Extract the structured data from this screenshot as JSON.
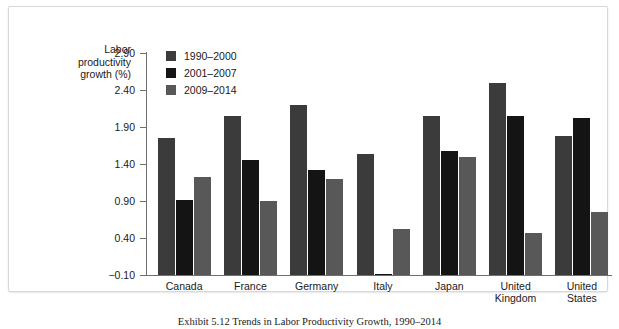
{
  "figure": {
    "caption": "Exhibit 5.12 Trends in Labor Productivity Growth, 1990–2014"
  },
  "chart_data": {
    "type": "bar",
    "title": "",
    "xlabel": "",
    "ylabel": "Labor productivity growth (%)",
    "ylabel_lines": [
      "Labor",
      "productivity",
      "growth (%)"
    ],
    "categories": [
      "Canada",
      "France",
      "Germany",
      "Italy",
      "Japan",
      "United Kingdom",
      "United States"
    ],
    "category_lines": [
      [
        "Canada"
      ],
      [
        "France"
      ],
      [
        "Germany"
      ],
      [
        "Italy"
      ],
      [
        "Japan"
      ],
      [
        "United",
        "Kingdom"
      ],
      [
        "United",
        "States"
      ]
    ],
    "series": [
      {
        "name": "1990–2000",
        "color": "#3b3b3b",
        "values": [
          1.75,
          2.05,
          2.2,
          1.53,
          2.05,
          2.5,
          1.78
        ]
      },
      {
        "name": "2001–2007",
        "color": "#141414",
        "values": [
          0.91,
          1.46,
          1.32,
          -0.09,
          1.58,
          2.05,
          2.02
        ]
      },
      {
        "name": "2009–2014",
        "color": "#585858",
        "values": [
          1.22,
          0.9,
          1.2,
          0.52,
          1.5,
          0.47,
          0.75
        ]
      }
    ],
    "ylim": [
      -0.1,
      2.9
    ],
    "yticks": [
      2.9,
      2.4,
      1.9,
      1.4,
      0.9,
      0.4,
      -0.1
    ],
    "ytick_labels": [
      "2.90",
      "2.40",
      "1.90",
      "1.40",
      "0.90",
      "0.40",
      "−0.10"
    ],
    "grid": false,
    "legend_position": "top-left-inside"
  }
}
